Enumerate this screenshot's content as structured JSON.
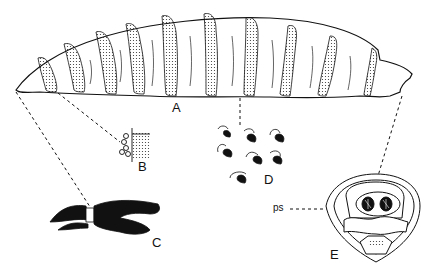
{
  "figure": {
    "labels": {
      "A": "A",
      "B": "B",
      "C": "C",
      "D": "D",
      "E": "E",
      "ps": "ps"
    },
    "parts": [
      {
        "id": "A",
        "description": "whole larva, lateral view"
      },
      {
        "id": "B",
        "description": "anterior spiracle"
      },
      {
        "id": "C",
        "description": "cephalopharyngeal skeleton"
      },
      {
        "id": "D",
        "description": "spines of body segment"
      },
      {
        "id": "E",
        "description": "posterior end with posterior spiracles",
        "callout": "ps"
      }
    ]
  }
}
